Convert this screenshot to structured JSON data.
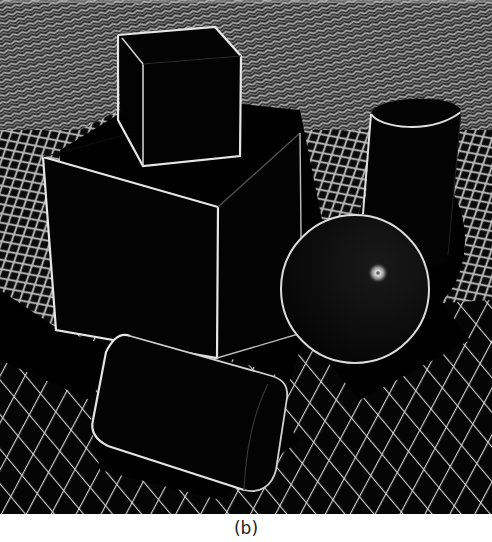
{
  "figure": {
    "caption": "(b)",
    "objects": [
      {
        "name": "small-cube",
        "position": "top-center, resting on large cube"
      },
      {
        "name": "large-cube",
        "position": "left-center"
      },
      {
        "name": "standing-cylinder",
        "position": "right"
      },
      {
        "name": "sphere",
        "position": "right-center",
        "feature": "specular highlight"
      },
      {
        "name": "lying-cylinder",
        "position": "bottom-center"
      }
    ],
    "colors": {
      "background": "#000000",
      "edge": "#e8e8e8",
      "grid_line": "#c8c8c8",
      "caption_text": "#222222",
      "page": "#ffffff"
    }
  }
}
